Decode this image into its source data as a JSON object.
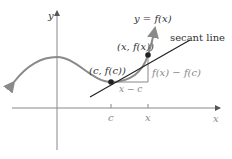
{
  "diagram": {
    "type": "secant-line-illustration",
    "axes": {
      "x_label": "x",
      "y_label": "y"
    },
    "curve_label": "y = f(x)",
    "secant_label": "secant line",
    "points": [
      {
        "label": "(c, f(c))"
      },
      {
        "label": "(x, f(x))"
      }
    ],
    "ticks": [
      {
        "label": "c"
      },
      {
        "label": "x"
      }
    ],
    "run_label": "x − c",
    "rise_label": "f(x) − f(c)",
    "colors": {
      "curve": "#8a8a8a",
      "axes": "#888888",
      "secant": "#222222",
      "points": "#222222",
      "triangle": "#888888"
    }
  }
}
